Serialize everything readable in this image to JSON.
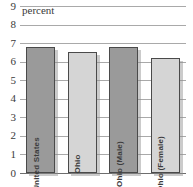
{
  "chart_data": {
    "type": "bar",
    "title": "",
    "subtitle": "",
    "xlabel": "",
    "ylabel": "percent",
    "ylim": [
      0,
      9
    ],
    "ytick_step": 1,
    "yticks": [
      "9",
      "8",
      "7",
      "6",
      "5",
      "4",
      "3",
      "2",
      "1",
      "0"
    ],
    "grid": true,
    "legend": "none",
    "categories": [
      "United States",
      "Ohio",
      "Ohio (Male)",
      "Ohio (Female)"
    ],
    "values": [
      6.8,
      6.5,
      6.8,
      6.2
    ],
    "series": [
      {
        "name": "percent",
        "values": [
          6.8,
          6.5,
          6.8,
          6.2
        ]
      }
    ],
    "bar_shades": [
      "dark",
      "light",
      "dark",
      "light"
    ],
    "colors": {
      "bar_dark": "#9a9a9a",
      "bar_light": "#d5d5d5",
      "bar_border": "#4a4a4a",
      "gridline": "#a9a9a9",
      "baseline": "#6e6e6e",
      "text": "#3a3a3a",
      "background": "#ffffff"
    }
  }
}
